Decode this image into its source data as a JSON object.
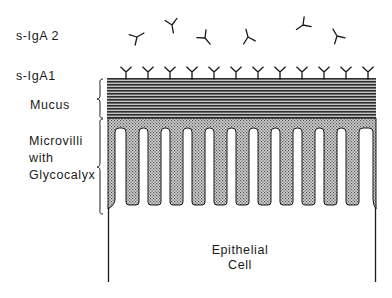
{
  "labels": {
    "s_iga2": "s-IgA 2",
    "s_iga1": "s-IgA1",
    "mucus": "Mucus",
    "microvilli_line1": "Microvilli",
    "microvilli_line2": "with",
    "microvilli_line3": "Glycocalyx",
    "cell_line1": "Epithelial",
    "cell_line2": "Cell"
  },
  "colors": {
    "ink": "#1a1a1a",
    "mucus_dark": "#2e2e2e",
    "mucus_light": "#bdbdbd",
    "glycocalyx_dark": "#555555",
    "glycocalyx_light": "#d6d6d6",
    "background": "#ffffff"
  },
  "counts": {
    "bound_antibodies": 12,
    "free_antibodies": 6,
    "microvilli": 11
  }
}
